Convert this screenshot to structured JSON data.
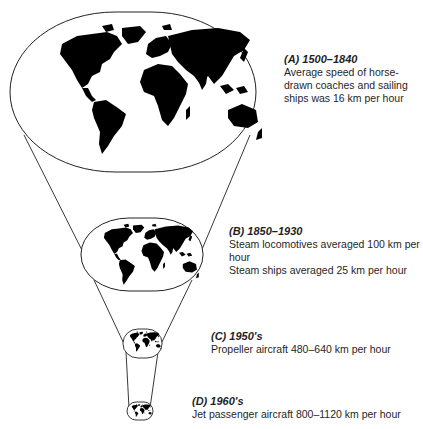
{
  "diagram": {
    "type": "shrinking-world-funnel",
    "stages": [
      {
        "id": "A",
        "letter": "(A)",
        "period": "1500–1840",
        "lines": [
          "Average speed of horse-",
          "drawn coaches and sailing",
          "ships was 16 km per hour"
        ]
      },
      {
        "id": "B",
        "letter": "(B)",
        "period": "1850–1930",
        "lines": [
          "Steam locomotives averaged 100 km per",
          "hour",
          "Steam ships averaged 25 km per hour"
        ]
      },
      {
        "id": "C",
        "letter": "(C)",
        "period": "1950's",
        "lines": [
          "Propeller aircraft 480–640 km per hour"
        ]
      },
      {
        "id": "D",
        "letter": "(D)",
        "period": "1960's",
        "lines": [
          "Jet passenger aircraft 800–1120 km per hour"
        ]
      }
    ],
    "colors": {
      "land": "#000000",
      "outline": "#222222",
      "background": "#ffffff"
    }
  }
}
